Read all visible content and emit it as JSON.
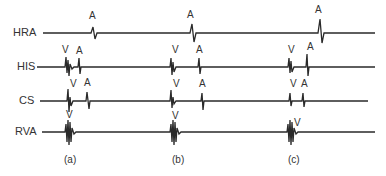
{
  "leads": [
    {
      "name": "HRA",
      "label_x": 13,
      "label_y": 27
    },
    {
      "name": "HIS",
      "label_x": 17,
      "label_y": 61
    },
    {
      "name": "CS",
      "label_x": 19,
      "label_y": 95
    },
    {
      "name": "RVA",
      "label_x": 15,
      "label_y": 126
    }
  ],
  "marks": {
    "A": "A",
    "V": "V"
  },
  "panels": [
    "(a)",
    "(b)",
    "(c)"
  ],
  "colors": {
    "trace": "#2a2a2a",
    "text": "#333333"
  }
}
